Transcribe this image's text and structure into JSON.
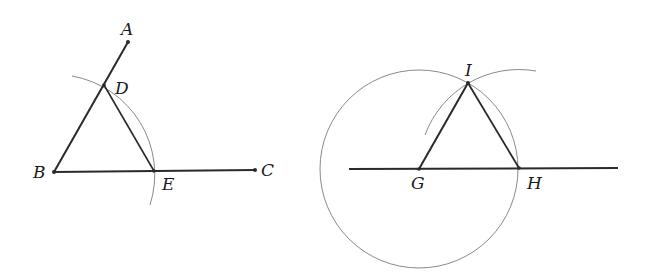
{
  "figures": [
    {
      "id": "angle-copy-source",
      "labels": {
        "A": "A",
        "B": "B",
        "C": "C",
        "D": "D",
        "E": "E"
      },
      "points": {
        "A": [
          128,
          42
        ],
        "B": [
          54,
          172
        ],
        "C": [
          255,
          170
        ],
        "D": [
          104,
          85
        ],
        "E": [
          154,
          171
        ]
      }
    },
    {
      "id": "equilateral-construction",
      "labels": {
        "G": "G",
        "H": "H",
        "I": "I"
      },
      "points": {
        "G": [
          419,
          169
        ],
        "H": [
          519,
          168
        ],
        "I": [
          468,
          83
        ]
      }
    }
  ],
  "colors": {
    "line": "#2a2a2a",
    "arc": "#8a8a8a",
    "background": "#ffffff"
  }
}
